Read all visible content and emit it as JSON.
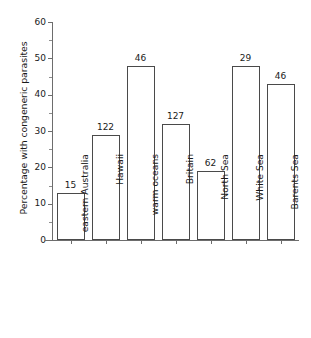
{
  "chart_data": {
    "type": "bar",
    "title": "",
    "subtitle": "",
    "xlabel": "",
    "ylabel": "Percentage with congeneric parasites",
    "categories": [
      "eastern Australia",
      "Hawaii",
      "warm oceans",
      "Britain",
      "North Sea",
      "White Sea",
      "Barents Sea"
    ],
    "values": [
      13,
      29,
      48,
      32,
      19,
      48,
      43
    ],
    "point_labels": [
      "15",
      "122",
      "46",
      "127",
      "62",
      "29",
      "46"
    ],
    "ylim": [
      0,
      60
    ],
    "ytick_labels": [
      "0",
      "10",
      "20",
      "30",
      "40",
      "50",
      "60"
    ],
    "ytick_values": [
      0,
      10,
      20,
      30,
      40,
      50,
      60
    ],
    "yminor_tick_values": [
      5,
      15,
      25,
      35,
      45,
      55
    ],
    "grid": false,
    "legend": null,
    "bar_fill_color": "#ffffff",
    "bar_edge_color": "#4a4a4a",
    "axis_color": "#6d6d6d",
    "text_color": "#1a1a1a",
    "background_color": "#ffffff"
  }
}
